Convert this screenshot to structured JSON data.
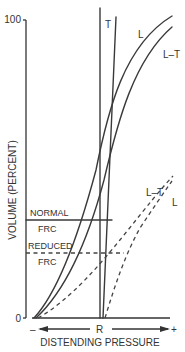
{
  "figure": {
    "y_axis": {
      "label": "VOLUME (PERCENT)",
      "tick_top": "100",
      "tick_bottom": "0"
    },
    "x_axis": {
      "label": "DISTENDING PRESSURE",
      "left_sign": "–",
      "center": "R",
      "right_sign": "+"
    },
    "frc_lines": {
      "normal_label_1": "NORMAL",
      "normal_label_2": "FRC",
      "reduced_label_1": "REDUCED",
      "reduced_label_2": "FRC"
    },
    "curve_labels": {
      "t": "T",
      "l_solid": "L",
      "lt_solid": "L–T",
      "lt_dashed": "L–T",
      "l_dashed": "L"
    },
    "colors": {
      "line": "#3a3a3a",
      "text": "#333333",
      "background": "#ffffff"
    }
  }
}
